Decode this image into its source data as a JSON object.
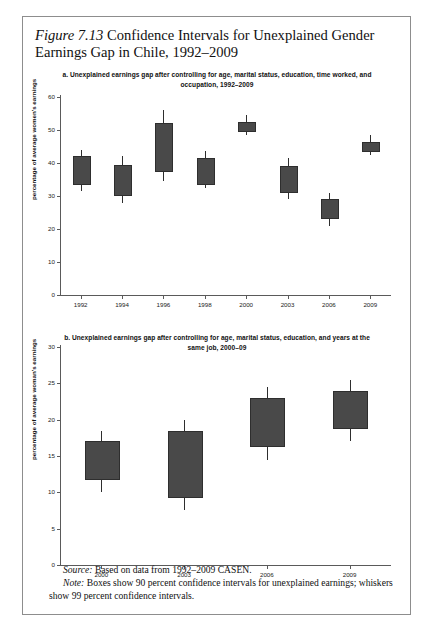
{
  "page": {
    "running_head": "",
    "figure_title_italic": "Figure 7.13",
    "figure_title_rest": " Confidence Intervals for Unexplained Gender Earnings Gap in Chile, 1992–2009",
    "source_label": "Source:",
    "source_text": " Based on data from 1992–2009 CASEN.",
    "note_label": "Note:",
    "note_text": " Boxes show 90 percent confidence intervals for unexplained earnings; whiskers show 99 percent confidence intervals.",
    "frame_color": "#8d8d8d",
    "box_fill": "#494949",
    "box_stroke": "#2e2e2e",
    "axis_color": "#5a5a5a"
  },
  "chart_data": [
    {
      "id": "panel-a",
      "type": "box",
      "title": "a. Unexplained earnings gap after controlling for age, marital status, education, time worked, and occupation, 1992–2009",
      "xlabel": "",
      "ylabel": "percentage of average women's earnings",
      "ylim": [
        0,
        60
      ],
      "yticks": [
        0,
        10,
        20,
        30,
        40,
        50,
        60
      ],
      "ytick_labels": [
        "0",
        "10",
        "20",
        "30",
        "40",
        "50",
        "60"
      ],
      "grid": false,
      "legend": "none",
      "categories": [
        "1992",
        "1994",
        "1996",
        "1998",
        "2000",
        "2003",
        "2006",
        "2009"
      ],
      "boxes": [
        {
          "category": "1992",
          "box_low": 34.0,
          "box_high": 42.0,
          "whisker_low": 31.5,
          "whisker_high": 44.0
        },
        {
          "category": "1994",
          "box_low": 30.5,
          "box_high": 39.5,
          "whisker_low": 28.0,
          "whisker_high": 42.0
        },
        {
          "category": "1996",
          "box_low": 38.0,
          "box_high": 52.0,
          "whisker_low": 34.5,
          "whisker_high": 56.0
        },
        {
          "category": "1998",
          "box_low": 34.0,
          "box_high": 41.5,
          "whisker_low": 32.5,
          "whisker_high": 43.5
        },
        {
          "category": "2000",
          "box_low": 50.0,
          "box_high": 52.5,
          "whisker_low": 48.5,
          "whisker_high": 54.5
        },
        {
          "category": "2003",
          "box_low": 31.5,
          "box_high": 39.0,
          "whisker_low": 29.0,
          "whisker_high": 41.5
        },
        {
          "category": "2006",
          "box_low": 23.5,
          "box_high": 29.0,
          "whisker_low": 21.0,
          "whisker_high": 31.0
        },
        {
          "category": "2009",
          "box_low": 44.0,
          "box_high": 46.5,
          "whisker_low": 42.5,
          "whisker_high": 48.5
        }
      ]
    },
    {
      "id": "panel-b",
      "type": "box",
      "title": "b. Unexplained earnings gap after controlling for age, marital status, education, and years at the same job, 2000–09",
      "xlabel": "",
      "ylabel": "percentage of average woman's earnings",
      "ylim": [
        0,
        30
      ],
      "yticks": [
        0,
        5,
        10,
        15,
        20,
        25,
        30
      ],
      "ytick_labels": [
        "0",
        "5",
        "10",
        "15",
        "20",
        "25",
        "30"
      ],
      "grid": false,
      "legend": "none",
      "categories": [
        "2000",
        "2003",
        "2006",
        "2009"
      ],
      "boxes": [
        {
          "category": "2000",
          "box_low": 12.0,
          "box_high": 17.0,
          "whisker_low": 10.0,
          "whisker_high": 18.5
        },
        {
          "category": "2003",
          "box_low": 9.5,
          "box_high": 18.5,
          "whisker_low": 7.5,
          "whisker_high": 20.0
        },
        {
          "category": "2006",
          "box_low": 16.5,
          "box_high": 23.0,
          "whisker_low": 14.5,
          "whisker_high": 24.5
        },
        {
          "category": "2009",
          "box_low": 19.0,
          "box_high": 24.0,
          "whisker_low": 17.0,
          "whisker_high": 25.5
        }
      ]
    }
  ]
}
